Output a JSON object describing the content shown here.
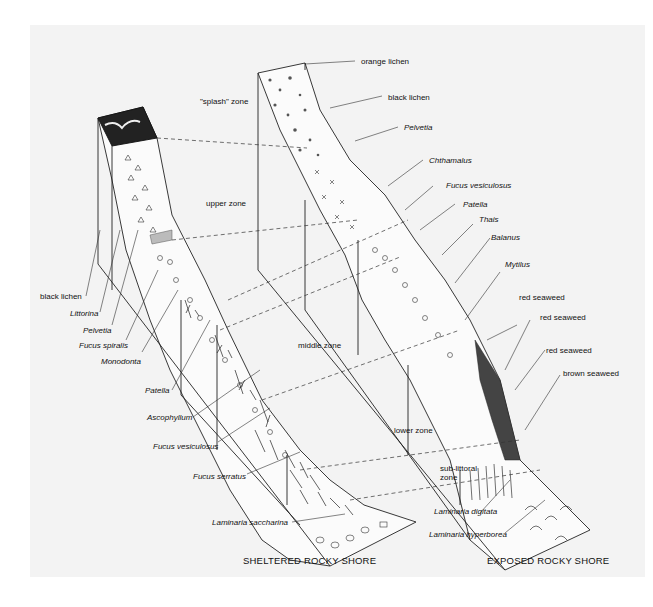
{
  "figure": {
    "titles": {
      "sheltered": "SHELTERED ROCKY SHORE",
      "exposed": "EXPOSED ROCKY SHORE"
    },
    "zones": {
      "splash": "\"splash\" zone",
      "upper": "upper zone",
      "middle": "middle zone",
      "lower": "lower zone",
      "sublittoral_1": "sub-littoral",
      "sublittoral_2": "zone"
    },
    "sheltered_labels": [
      "black lichen",
      "Littorina",
      "Pelvetia",
      "Fucus spiralis",
      "Monodonta",
      "Patella",
      "Ascophyllum",
      "Fucus vesiculosus",
      "Fucus serratus",
      "Laminaria saccharina"
    ],
    "exposed_labels": [
      "orange lichen",
      "black lichen",
      "Pelvetia",
      "Chthamalus",
      "Fucus vesiculosus",
      "Patella",
      "Thais",
      "Balanus",
      "Mytilus",
      "red seaweed",
      "red seaweed",
      "red seaweed",
      "brown seaweed",
      "Laminaria digitata",
      "Laminaria hyperborea"
    ],
    "colors": {
      "background": "#ffffff",
      "panel": "#f3f3f3",
      "ink": "#111111"
    }
  }
}
